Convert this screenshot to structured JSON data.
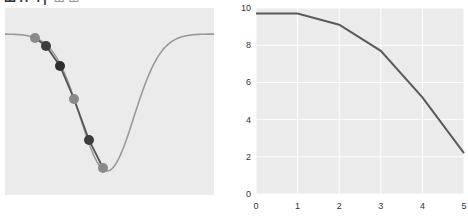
{
  "header": {
    "title_partial": "Ш Н Ч | ",
    "subtitle_partial": "Ш Ш"
  },
  "colors": {
    "panel_bg": "#ebebeb",
    "grid": "#ffffff",
    "curve": "#9a9a9a",
    "fit_line": "#555555",
    "marker_light": "#8a8a8a",
    "marker_dark": "#3c3c3c",
    "line_right": "#5a5a5a"
  },
  "chart_data": [
    {
      "type": "line",
      "title": "",
      "description": "Gaussian-dip curve with gradient-descent steps (markers) descending the left slope",
      "xlabel": "",
      "ylabel": "",
      "grid": false,
      "axes_visible": false,
      "series": [
        {
          "name": "curve",
          "shape": "inverted gaussian dip"
        },
        {
          "name": "steps",
          "points_px": [
            [
              35,
              38
            ],
            [
              46,
              46
            ],
            [
              60,
              66
            ],
            [
              74,
              99
            ],
            [
              89,
              140
            ],
            [
              103,
              168
            ]
          ],
          "marker_shades": [
            "light",
            "dark",
            "darker",
            "light",
            "dark",
            "light"
          ]
        }
      ]
    },
    {
      "type": "line",
      "title": "",
      "xlabel": "",
      "ylabel": "",
      "x": [
        0,
        1,
        2,
        3,
        4,
        5
      ],
      "series": [
        {
          "name": "value",
          "values": [
            9.7,
            9.7,
            9.1,
            7.7,
            5.2,
            2.2
          ]
        }
      ],
      "xticks": [
        "0",
        "1",
        "2",
        "3",
        "4",
        "5"
      ],
      "yticks": [
        "0",
        "2",
        "4",
        "6",
        "8",
        "10"
      ],
      "xlim": [
        0,
        5
      ],
      "ylim": [
        0,
        10
      ],
      "grid": true
    }
  ]
}
